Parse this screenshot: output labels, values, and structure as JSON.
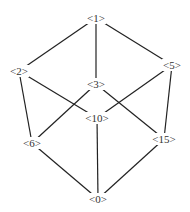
{
  "diagram": {
    "type": "hasse-lattice",
    "line_color": "#222222",
    "text_color": "#333333",
    "nodes": [
      {
        "id": "1",
        "label": "<1>",
        "x": 96,
        "y": 18
      },
      {
        "id": "2",
        "label": "<2>",
        "x": 19,
        "y": 71
      },
      {
        "id": "5",
        "label": "<5>",
        "x": 172,
        "y": 65
      },
      {
        "id": "3",
        "label": "<3>",
        "x": 96,
        "y": 84
      },
      {
        "id": "10",
        "label": "<10>",
        "x": 97,
        "y": 118
      },
      {
        "id": "6",
        "label": "<6>",
        "x": 32,
        "y": 143
      },
      {
        "id": "15",
        "label": "<15>",
        "x": 164,
        "y": 139
      },
      {
        "id": "0",
        "label": "<0>",
        "x": 98,
        "y": 199
      }
    ],
    "edges": [
      [
        "1",
        "2"
      ],
      [
        "1",
        "3"
      ],
      [
        "1",
        "5"
      ],
      [
        "2",
        "6"
      ],
      [
        "2",
        "10"
      ],
      [
        "5",
        "10"
      ],
      [
        "5",
        "15"
      ],
      [
        "3",
        "6"
      ],
      [
        "3",
        "15"
      ],
      [
        "10",
        "0"
      ],
      [
        "6",
        "0"
      ],
      [
        "15",
        "0"
      ]
    ]
  }
}
